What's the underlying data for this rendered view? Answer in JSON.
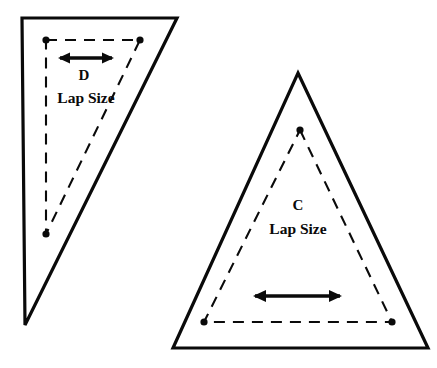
{
  "diagram": {
    "background_color": "#ffffff",
    "stroke_color": "#0a0a0a",
    "width": 437,
    "height": 368
  },
  "shapes": [
    {
      "id": "shape-d",
      "letter": "D",
      "caption": "Lap Size",
      "letter_pos": {
        "x": 84,
        "y": 80
      },
      "caption_pos": {
        "x": 86,
        "y": 103
      },
      "outline_points": "22,18 177,18 25,325",
      "inner_points": "46,40 140,40 46,234",
      "dots": [
        {
          "x": 46,
          "y": 40
        },
        {
          "x": 140,
          "y": 40
        },
        {
          "x": 46,
          "y": 234
        }
      ],
      "arrow": {
        "x1": 60,
        "x2": 112,
        "y": 58
      }
    },
    {
      "id": "shape-c",
      "letter": "C",
      "caption": "Lap Size",
      "letter_pos": {
        "x": 298,
        "y": 210
      },
      "caption_pos": {
        "x": 298,
        "y": 234
      },
      "outline_points": "298,73 428,348 173,348",
      "inner_points": "300,130 392,322 204,322",
      "dots": [
        {
          "x": 300,
          "y": 130
        },
        {
          "x": 392,
          "y": 322
        },
        {
          "x": 204,
          "y": 322
        }
      ],
      "arrow": {
        "x1": 255,
        "x2": 340,
        "y": 296
      }
    }
  ],
  "chart_data": {
    "type": "diagram",
    "items": [
      {
        "label": "D",
        "caption": "Lap Size",
        "shape": "scalene right-leaning triangle",
        "outer_vertices": [
          [
            22,
            18
          ],
          [
            177,
            18
          ],
          [
            25,
            325
          ]
        ],
        "inner_vertices": [
          [
            46,
            40
          ],
          [
            140,
            40
          ],
          [
            46,
            234
          ]
        ],
        "dimension_arrow": {
          "from": [
            60,
            58
          ],
          "to": [
            112,
            58
          ],
          "orientation": "horizontal",
          "double_headed": true
        }
      },
      {
        "label": "C",
        "caption": "Lap Size",
        "shape": "isosceles triangle",
        "outer_vertices": [
          [
            298,
            73
          ],
          [
            428,
            348
          ],
          [
            173,
            348
          ]
        ],
        "inner_vertices": [
          [
            300,
            130
          ],
          [
            392,
            322
          ],
          [
            204,
            322
          ]
        ],
        "dimension_arrow": {
          "from": [
            255,
            296
          ],
          "to": [
            340,
            296
          ],
          "orientation": "horizontal",
          "double_headed": true
        }
      }
    ]
  }
}
